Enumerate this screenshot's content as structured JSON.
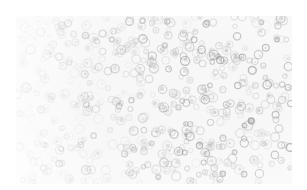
{
  "image": {
    "kind": "grayscale microscopy photograph of densely packed round cells",
    "background_color": "#f7f7f7",
    "cell_color_dark": "#8a8a8a",
    "cell_color_light": "#c8c8c8",
    "cell_count": 520,
    "cell_radius_min": 2.2,
    "cell_radius_max": 4.6,
    "seed": 17
  }
}
